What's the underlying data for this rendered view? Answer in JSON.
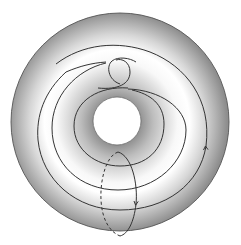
{
  "diagram": {
    "title": "Torus with winding curve and meridian loop",
    "elements": {
      "torus": "torus surface (top view, shaded)",
      "hole": "central hole",
      "winding_curve": "curve spiraling around the torus with a crossing near the top",
      "meridian": "meridian loop through the hole (front solid, back dashed)",
      "arrow_right": "orientation arrow on winding curve (pointing up)",
      "arrow_meridian": "orientation arrow on meridian (pointing down)"
    },
    "colors": {
      "background": "#ffffff",
      "surface_light": "#f4f4f4",
      "surface_dark": "#9a9a9a",
      "stroke": "#333333"
    }
  }
}
